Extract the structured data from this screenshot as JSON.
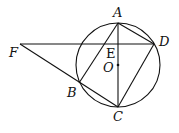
{
  "diagram": {
    "type": "geometry",
    "circle": {
      "center": "O",
      "cx": 118,
      "cy": 65,
      "r": 42
    },
    "points": {
      "A": {
        "x": 118,
        "y": 23,
        "label": "A",
        "lx": 113,
        "ly": 17
      },
      "B": {
        "x": 79,
        "y": 83,
        "label": "B",
        "lx": 66,
        "ly": 97
      },
      "C": {
        "x": 118,
        "y": 107,
        "label": "C",
        "lx": 113,
        "ly": 121
      },
      "D": {
        "x": 154,
        "y": 44,
        "label": "D",
        "lx": 159,
        "ly": 46
      },
      "E": {
        "x": 118,
        "y": 44,
        "label": "E",
        "lx": 105,
        "ly": 58
      },
      "F": {
        "x": 20,
        "y": 44,
        "label": "F",
        "lx": 9,
        "ly": 57
      },
      "O": {
        "x": 118,
        "y": 65,
        "label": "O",
        "lx": 102,
        "ly": 72
      }
    },
    "segments": [
      "AC",
      "AD",
      "AB",
      "DC",
      "FD",
      "FC",
      "BC"
    ],
    "labels": [
      "A",
      "B",
      "C",
      "D",
      "E",
      "F",
      "O"
    ]
  }
}
